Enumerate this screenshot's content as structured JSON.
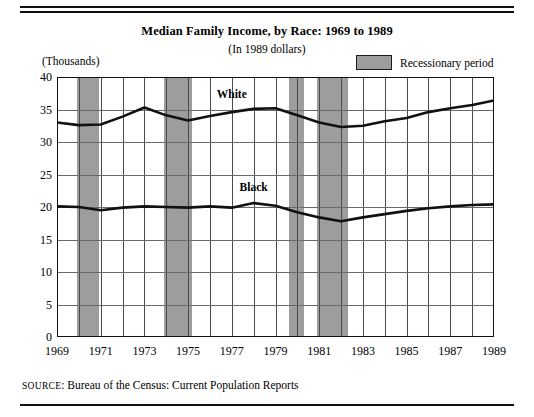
{
  "header": {
    "title": "Median Family Income, by Race: 1969 to 1989",
    "subtitle": "(In 1989 dollars)",
    "units_label": "(Thousands)"
  },
  "legend": {
    "swatch_name": "recession-swatch",
    "label": "Recessionary period",
    "swatch_color": "#9d9d9d"
  },
  "source": {
    "prefix": "SOURCE",
    "text": ": Bureau of the Census: Current Population Reports"
  },
  "chart_data": {
    "type": "line",
    "title": "Median Family Income, by Race: 1969 to 1989",
    "subtitle": "(In 1989 dollars)",
    "xlabel": "",
    "ylabel": "(Thousands)",
    "xlim": [
      1969,
      1989
    ],
    "ylim": [
      0,
      40
    ],
    "grid": true,
    "legend_position": "top-right",
    "x": [
      1969,
      1970,
      1971,
      1972,
      1973,
      1974,
      1975,
      1976,
      1977,
      1978,
      1979,
      1980,
      1981,
      1982,
      1983,
      1984,
      1985,
      1986,
      1987,
      1988,
      1989
    ],
    "xticklabels": [
      "1969",
      "1971",
      "1973",
      "1975",
      "1977",
      "1979",
      "1981",
      "1983",
      "1985",
      "1987",
      "1989"
    ],
    "xtickvalues": [
      1969,
      1971,
      1973,
      1975,
      1977,
      1979,
      1981,
      1983,
      1985,
      1987,
      1989
    ],
    "yticklabels": [
      "0",
      "5",
      "10",
      "15",
      "20",
      "25",
      "30",
      "35",
      "40"
    ],
    "ytickvalues": [
      0,
      5,
      10,
      15,
      20,
      25,
      30,
      35,
      40
    ],
    "series": [
      {
        "name": "White",
        "label_x": 1977,
        "label_y": 37.2,
        "color": "#111111",
        "values": [
          33.0,
          32.6,
          32.7,
          33.9,
          35.3,
          34.1,
          33.3,
          34.0,
          34.6,
          35.1,
          35.2,
          34.1,
          33.0,
          32.3,
          32.5,
          33.2,
          33.7,
          34.6,
          35.2,
          35.7,
          36.4
        ]
      },
      {
        "name": "Black",
        "label_x": 1978,
        "label_y": 23.0,
        "color": "#111111",
        "values": [
          20.1,
          20.0,
          19.5,
          19.9,
          20.1,
          20.0,
          19.9,
          20.1,
          19.9,
          20.6,
          20.2,
          19.2,
          18.4,
          17.8,
          18.4,
          18.9,
          19.4,
          19.8,
          20.1,
          20.3,
          20.4
        ]
      }
    ],
    "recession_bands": [
      {
        "start": 1969.9,
        "end": 1970.9
      },
      {
        "start": 1973.9,
        "end": 1975.2
      },
      {
        "start": 1979.6,
        "end": 1980.3
      },
      {
        "start": 1980.9,
        "end": 1982.3
      }
    ]
  }
}
